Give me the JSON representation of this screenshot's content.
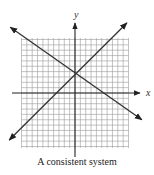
{
  "caption": "A consistent system",
  "chart_data": {
    "type": "line",
    "title": "A consistent system",
    "xlabel": "x",
    "ylabel": "y",
    "xlim": [
      -10,
      10
    ],
    "ylim": [
      -10,
      10
    ],
    "grid": true,
    "series": [
      {
        "name": "decreasing line",
        "points": [
          [
            -12.1,
            12.3
          ],
          [
            12.5,
            -5.0
          ]
        ],
        "arrows": "both"
      },
      {
        "name": "increasing line",
        "points": [
          [
            -12.3,
            -8.8
          ],
          [
            9.7,
            13.1
          ]
        ],
        "arrows": "both"
      }
    ],
    "intersection": [
      0,
      3.7
    ],
    "colors": {
      "grid": "#9a9a9a",
      "axis": "#222222",
      "line": "#333333"
    }
  }
}
